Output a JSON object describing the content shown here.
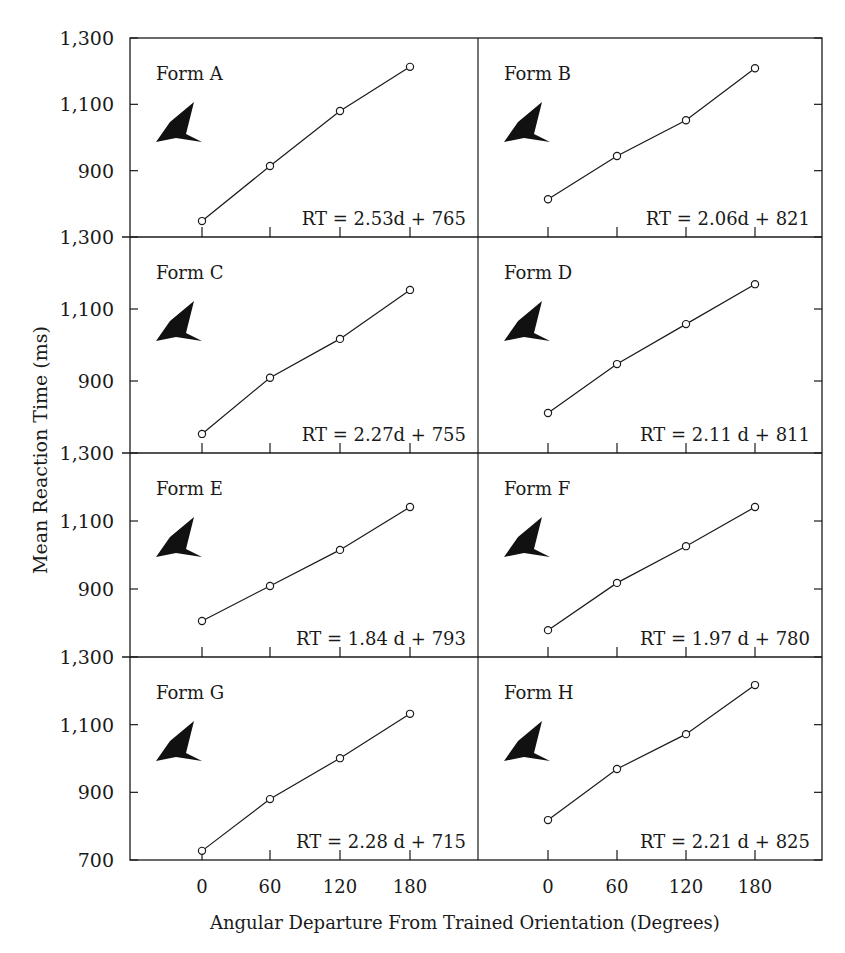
{
  "chart_data": {
    "type": "line",
    "title": "",
    "xlabel": "Angular Departure From Trained Orientation (Degrees)",
    "ylabel": "Mean Reaction Time (ms)",
    "x": [
      0,
      60,
      120,
      180
    ],
    "x_ticks": [
      "0",
      "60",
      "120",
      "180"
    ],
    "y_ticks": [
      "700",
      "900",
      "1,100",
      "1,300"
    ],
    "ylim": [
      700,
      1300
    ],
    "grid": false,
    "layout": "4 rows x 2 columns of small-multiple panels",
    "panels": [
      {
        "name": "Form A",
        "equation": "RT = 2.53d + 765",
        "values": [
          748,
          914,
          1080,
          1213
        ]
      },
      {
        "name": "Form B",
        "equation": "RT = 2.06d + 821",
        "values": [
          814,
          944,
          1052,
          1209
        ]
      },
      {
        "name": "Form C",
        "equation": "RT = 2.27d + 755",
        "values": [
          753,
          909,
          1017,
          1153
        ]
      },
      {
        "name": "Form D",
        "equation": "RT = 2.11 d + 811",
        "values": [
          811,
          947,
          1058,
          1169
        ]
      },
      {
        "name": "Form E",
        "equation": "RT = 1.84 d + 793",
        "values": [
          806,
          909,
          1015,
          1141
        ]
      },
      {
        "name": "Form F",
        "equation": "RT = 1.97 d + 780",
        "values": [
          779,
          918,
          1026,
          1141
        ]
      },
      {
        "name": "Form G",
        "equation": "RT = 2.28 d + 715",
        "values": [
          727,
          880,
          1001,
          1132
        ]
      },
      {
        "name": "Form H",
        "equation": "RT = 2.21 d + 825",
        "values": [
          818,
          969,
          1072,
          1217
        ]
      }
    ]
  }
}
